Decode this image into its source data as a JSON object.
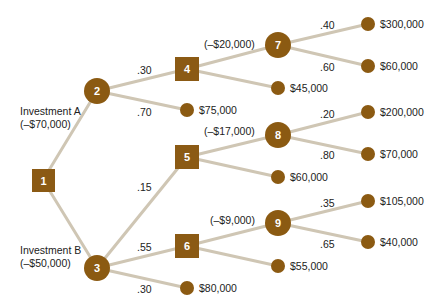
{
  "colors": {
    "node_fill": "#8b5a12",
    "square_fill": "#8b5a14",
    "edge": "#cfc6b4",
    "text": "#222222",
    "node_text": "#ffffff"
  },
  "nodes": {
    "n1": {
      "id": "1",
      "type": "decision"
    },
    "n2": {
      "id": "2",
      "type": "chance"
    },
    "n3": {
      "id": "3",
      "type": "chance"
    },
    "n4": {
      "id": "4",
      "type": "decision"
    },
    "n5": {
      "id": "5",
      "type": "decision"
    },
    "n6": {
      "id": "6",
      "type": "decision"
    },
    "n7": {
      "id": "7",
      "type": "chance"
    },
    "n8": {
      "id": "8",
      "type": "chance"
    },
    "n9": {
      "id": "9",
      "type": "chance"
    }
  },
  "branches": {
    "investment_a": {
      "line1": "Investment A",
      "line2": "(–$70,000)"
    },
    "investment_b": {
      "line1": "Investment B",
      "line2": "(–$50,000)"
    },
    "cost_7": "(–$20,000)",
    "cost_8": "(–$17,000)",
    "cost_9": "(–$9,000)"
  },
  "probabilities": {
    "p2_4": ".30",
    "p2_t": ".70",
    "p3_5": ".15",
    "p3_6": ".55",
    "p3_t": ".30",
    "p7_a": ".40",
    "p7_b": ".60",
    "p8_a": ".20",
    "p8_b": ".80",
    "p9_a": ".35",
    "p9_b": ".65"
  },
  "payoffs": {
    "t2": "$75,000",
    "t4": "$45,000",
    "t5": "$60,000",
    "t6": "$55,000",
    "t3": "$80,000",
    "t7a": "$300,000",
    "t7b": "$60,000",
    "t8a": "$200,000",
    "t8b": "$70,000",
    "t9a": "$105,000",
    "t9b": "$40,000"
  }
}
